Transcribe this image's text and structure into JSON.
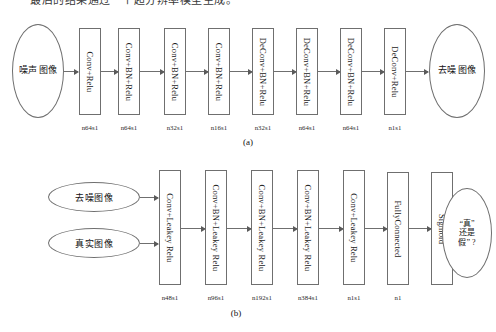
{
  "header": {
    "clipped_text": "最后的结果通过一个超分辨率模型生成。"
  },
  "panels": [
    {
      "caption": "(a)",
      "input_nodes": [
        {
          "name": "noisy-image-input",
          "columns": [
            "噪声",
            "图像"
          ]
        }
      ],
      "output_nodes": [
        {
          "name": "denoised-image-output",
          "columns": [
            "去噪",
            "图像"
          ]
        }
      ],
      "blocks": [
        {
          "label": "Conv+Relu",
          "n": "n64s1"
        },
        {
          "label": "Conv+BN+Relu",
          "n": "n64s1"
        },
        {
          "label": "Conv+BN+Relu",
          "n": "n32s1"
        },
        {
          "label": "Conv+BN+Relu",
          "n": "n16s1"
        },
        {
          "label": "DeConv+BN+Relu",
          "n": "n32s1"
        },
        {
          "label": "DeConv+BN+Relu",
          "n": "n64s1"
        },
        {
          "label": "DeConv+BN+Relu",
          "n": "n64s1"
        },
        {
          "label": "DeConv+Relu",
          "n": "n1s1"
        }
      ]
    },
    {
      "caption": "(b)",
      "input_nodes": [
        {
          "name": "denoised-image-input",
          "text": "去噪图像"
        },
        {
          "name": "real-image-input",
          "text": "真实图像"
        }
      ],
      "output_nodes": [
        {
          "name": "real-or-fake-output",
          "lines": [
            "“真”",
            "还是",
            "假”  ?"
          ]
        }
      ],
      "blocks": [
        {
          "label": "Conv+Leakey Relu",
          "n": "n48s1"
        },
        {
          "label": "Conv+BN+Leakey Relu",
          "n": "n96s1"
        },
        {
          "label": "Conv+BN+Leakey Relu",
          "n": "n192s1"
        },
        {
          "label": "Conv+BN+Leakey Relu",
          "n": "n384s1"
        },
        {
          "label": "Conv+Leakey Relu",
          "n": "n1s1"
        },
        {
          "label": "FullyConnected",
          "n": "n1"
        },
        {
          "label": "Sigmoid",
          "n": ""
        }
      ]
    }
  ]
}
